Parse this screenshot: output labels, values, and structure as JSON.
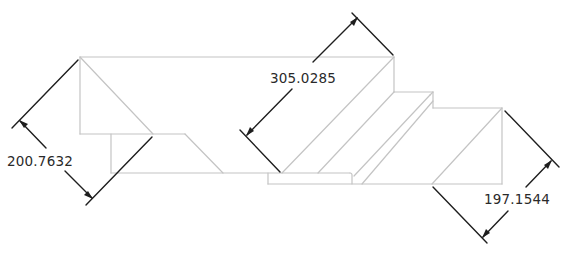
{
  "drawing": {
    "type": "technical-dimension-drawing",
    "colors": {
      "geometry_line": "#c4c4c4",
      "dimension_line": "#1e1e1e",
      "text": "#2a2a2a",
      "background": "#ffffff"
    },
    "dimensions": [
      {
        "id": "left",
        "label": "200.7632"
      },
      {
        "id": "middle",
        "label": "305.0285"
      },
      {
        "id": "right",
        "label": "197.1544"
      }
    ]
  }
}
